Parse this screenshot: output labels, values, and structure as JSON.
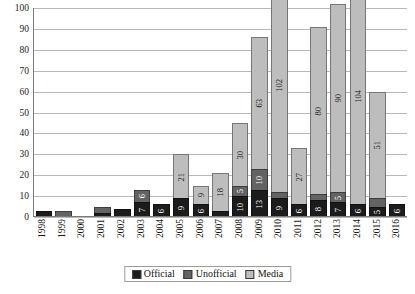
{
  "chart_data": {
    "type": "bar",
    "stacked": true,
    "title": "",
    "xlabel": "",
    "ylabel": "",
    "ylim": [
      0,
      100
    ],
    "ytick_step": 10,
    "grid": true,
    "legend_position": "bottom",
    "categories": [
      "1998",
      "1999",
      "2000",
      "2001",
      "2002",
      "2003",
      "2004",
      "2005",
      "2006",
      "2007",
      "2008",
      "2009",
      "2010",
      "2011",
      "2012",
      "2013",
      "2014",
      "2015",
      "2016"
    ],
    "series": [
      {
        "name": "Official",
        "color": "#1c1c1c",
        "values": [
          3,
          0,
          0,
          2,
          4,
          7,
          6,
          9,
          6,
          3,
          10,
          13,
          9,
          6,
          8,
          7,
          6,
          5,
          6
        ]
      },
      {
        "name": "Unofficial",
        "color": "#636363",
        "values": [
          0,
          3,
          0,
          3,
          0,
          6,
          0,
          0,
          0,
          0,
          5,
          10,
          3,
          0,
          3,
          5,
          0,
          4,
          0
        ]
      },
      {
        "name": "Media",
        "color": "#bdbdbd",
        "values": [
          0,
          0,
          0,
          0,
          0,
          0,
          0,
          21,
          9,
          18,
          30,
          63,
          102,
          27,
          80,
          90,
          104,
          51,
          0
        ]
      }
    ],
    "ytick_labels": [
      "0",
      "10",
      "20",
      "30",
      "40",
      "50",
      "60",
      "70",
      "80",
      "90",
      "100"
    ]
  },
  "legend": {
    "items": [
      {
        "label": "Official",
        "swatch": "official"
      },
      {
        "label": "Unofficial",
        "swatch": "unofficial"
      },
      {
        "label": "Media",
        "swatch": "media"
      }
    ]
  }
}
